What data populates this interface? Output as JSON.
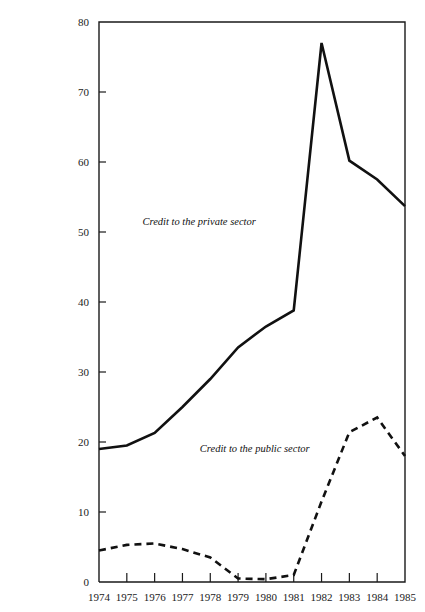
{
  "chart_data": {
    "type": "line",
    "title": "",
    "xlabel": "",
    "ylabel": "",
    "x": [
      1974,
      1975,
      1976,
      1977,
      1978,
      1979,
      1980,
      1981,
      1982,
      1983,
      1984,
      1985
    ],
    "xtick_labels": [
      "1974",
      "1975",
      "1976",
      "1977",
      "1978",
      "1979",
      "1980",
      "1981",
      "1982",
      "1983",
      "1984",
      "1985"
    ],
    "ytick_labels": [
      "0",
      "10",
      "20",
      "30",
      "40",
      "50",
      "60",
      "70",
      "80"
    ],
    "yticks": [
      0,
      10,
      20,
      30,
      40,
      50,
      60,
      70,
      80
    ],
    "ylim": [
      0,
      80
    ],
    "xlim": [
      1974,
      1985
    ],
    "grid": false,
    "legend": "inline-annotations",
    "series": [
      {
        "name": "Credit to the private sector",
        "style": "solid",
        "color": "#111111",
        "values": [
          19.0,
          19.5,
          21.3,
          25.0,
          29.0,
          33.5,
          36.5,
          38.8,
          77.0,
          60.2,
          57.5,
          53.7
        ]
      },
      {
        "name": "Credit to the public sector",
        "style": "dashed",
        "color": "#111111",
        "values": [
          4.5,
          5.3,
          5.5,
          4.7,
          3.5,
          0.5,
          0.4,
          1.0,
          11.5,
          21.4,
          23.5,
          18.0
        ]
      }
    ],
    "annotations": [
      {
        "text": "Credit to the private sector",
        "x": 1977.6,
        "y": 51.0
      },
      {
        "text": "Credit to the public sector",
        "x": 1979.6,
        "y": 18.6
      }
    ]
  }
}
